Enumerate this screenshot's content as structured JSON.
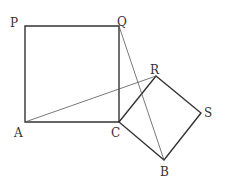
{
  "diagram": {
    "type": "geometry",
    "points": {
      "P": {
        "label": "P",
        "x": 25,
        "y": 26
      },
      "Q": {
        "label": "Q",
        "x": 119,
        "y": 26
      },
      "A": {
        "label": "A",
        "x": 25,
        "y": 122
      },
      "C": {
        "label": "C",
        "x": 119,
        "y": 122
      },
      "R": {
        "label": "R",
        "x": 156,
        "y": 76
      },
      "S": {
        "label": "S",
        "x": 201,
        "y": 113
      },
      "B": {
        "label": "B",
        "x": 164,
        "y": 160
      }
    },
    "shapes": [
      {
        "name": "square-APQC",
        "vertices": [
          "P",
          "Q",
          "C",
          "A"
        ]
      },
      {
        "name": "square-CRSB",
        "vertices": [
          "C",
          "R",
          "S",
          "B"
        ]
      }
    ],
    "segments": [
      {
        "name": "segment-AR",
        "from": "A",
        "to": "R"
      },
      {
        "name": "segment-QB",
        "from": "Q",
        "to": "B"
      }
    ],
    "colors": {
      "stroke": "#333333",
      "thin_stroke": "#555555",
      "background": "#ffffff"
    }
  }
}
